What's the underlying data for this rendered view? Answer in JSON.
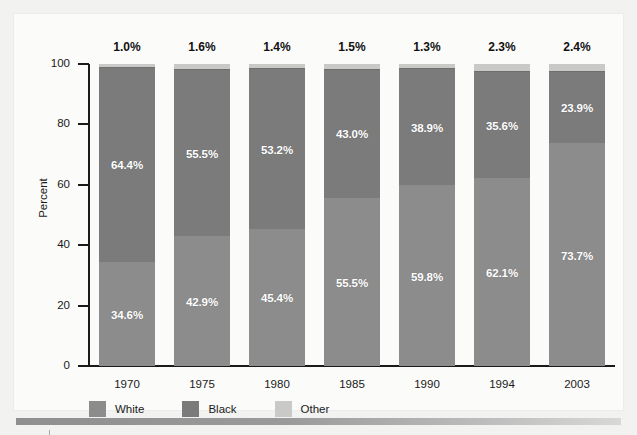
{
  "chart_data": {
    "type": "bar",
    "subtype": "stacked-bar-100-percent",
    "title": "",
    "xlabel": "",
    "ylabel": "Percent",
    "ylim": [
      0,
      100
    ],
    "yticks": [
      0,
      20,
      40,
      60,
      80,
      100
    ],
    "ytick_labels": [
      "0",
      "20",
      "40",
      "60",
      "80",
      "100"
    ],
    "grid": false,
    "legend_position": "bottom-left",
    "categories": [
      "1970",
      "1975",
      "1980",
      "1985",
      "1990",
      "1994",
      "2003"
    ],
    "series": [
      {
        "name": "White",
        "color": "#8c8c8c",
        "values": [
          34.6,
          42.9,
          45.4,
          55.5,
          59.8,
          62.1,
          73.7
        ],
        "labels": [
          "34.6%",
          "42.9%",
          "45.4%",
          "55.5%",
          "59.8%",
          "62.1%",
          "73.7%"
        ]
      },
      {
        "name": "Black",
        "color": "#7b7b7b",
        "values": [
          64.4,
          55.5,
          53.2,
          43.0,
          38.9,
          35.6,
          23.9
        ],
        "labels": [
          "64.4%",
          "55.5%",
          "53.2%",
          "43.0%",
          "38.9%",
          "35.6%",
          "23.9%"
        ]
      },
      {
        "name": "Other",
        "color": "#c9c9c7",
        "values": [
          1.0,
          1.6,
          1.4,
          1.5,
          1.3,
          2.3,
          2.4
        ],
        "labels": [
          "1.0%",
          "1.6%",
          "1.4%",
          "1.5%",
          "1.3%",
          "2.3%",
          "2.4%"
        ]
      }
    ]
  },
  "axis": {
    "y_title": "Percent"
  },
  "legend": {
    "items": [
      {
        "label": "White",
        "swatch": "#8c8c8c"
      },
      {
        "label": "Black",
        "swatch": "#7b7b7b"
      },
      {
        "label": "Other",
        "swatch": "#c9c9c7"
      }
    ]
  }
}
